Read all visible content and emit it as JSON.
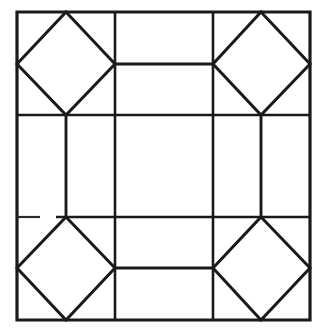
{
  "document": {
    "title": "Octagon and Square Tiling Pattern",
    "description": "Line drawing of a square frame divided by a 3 by 3 grid, with a diamond inscribed in each of the four corner cells and an octagonal outline formed in the center.",
    "background_color": "#ffffff",
    "ink_color": "#1a1a1a"
  },
  "canvas": {
    "width": 321,
    "height": 330
  },
  "chart_data": {
    "type": "diagram",
    "outer_frame": {
      "x_left": 17,
      "y_top": 12,
      "x_right": 310,
      "y_bottom": 320,
      "width": 293,
      "height": 308
    },
    "grid": {
      "vertical_lines_x": [
        115,
        213
      ],
      "horizontal_lines_y": [
        115,
        217
      ],
      "columns": 3,
      "rows": 3
    },
    "cell_midpoints": {
      "top_band_mid_y": 64,
      "bottom_band_mid_y": 268,
      "left_band_mid_x": 66,
      "right_band_mid_x": 261
    },
    "diamonds": [
      {
        "name": "top-left-diamond",
        "cell": "row1-col1",
        "vertices": [
          [
            66,
            12
          ],
          [
            115,
            64
          ],
          [
            66,
            115
          ],
          [
            17,
            64
          ]
        ]
      },
      {
        "name": "top-right-diamond",
        "cell": "row1-col3",
        "vertices": [
          [
            261,
            12
          ],
          [
            310,
            64
          ],
          [
            261,
            115
          ],
          [
            213,
            64
          ]
        ]
      },
      {
        "name": "bottom-left-diamond",
        "cell": "row3-col1",
        "vertices": [
          [
            66,
            217
          ],
          [
            115,
            268
          ],
          [
            66,
            320
          ],
          [
            17,
            268
          ]
        ]
      },
      {
        "name": "bottom-right-diamond",
        "cell": "row3-col3",
        "vertices": [
          [
            261,
            217
          ],
          [
            310,
            268
          ],
          [
            261,
            320
          ],
          [
            213,
            268
          ]
        ]
      }
    ],
    "inner_octagon_edges": [
      {
        "name": "top-edge",
        "from": [
          115,
          64
        ],
        "to": [
          213,
          64
        ]
      },
      {
        "name": "bottom-edge",
        "from": [
          115,
          268
        ],
        "to": [
          213,
          268
        ]
      },
      {
        "name": "left-edge",
        "from": [
          66,
          115
        ],
        "to": [
          66,
          217
        ]
      },
      {
        "name": "right-edge",
        "from": [
          261,
          115
        ],
        "to": [
          261,
          217
        ]
      }
    ],
    "artifacts": [
      {
        "name": "broken-segment-lower-left-gridline",
        "line": "horizontal-gridline-2",
        "gap_x_from": 40,
        "gap_x_to": 56,
        "note": "hand-drawn line shows a faint break"
      }
    ],
    "legend": [],
    "annotations": [],
    "labels": []
  }
}
